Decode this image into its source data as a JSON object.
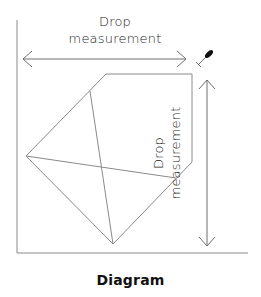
{
  "diagram": {
    "caption": "Diagram",
    "horizontal_label": {
      "line1": "Drop",
      "line2": "measurement"
    },
    "vertical_label": {
      "line1": "Drop",
      "line2": "measurement"
    },
    "icons": {
      "pin": "pin-icon"
    },
    "colors": {
      "line": "#8a8a8a",
      "text": "#1a1a1a",
      "pin": "#111111"
    }
  }
}
